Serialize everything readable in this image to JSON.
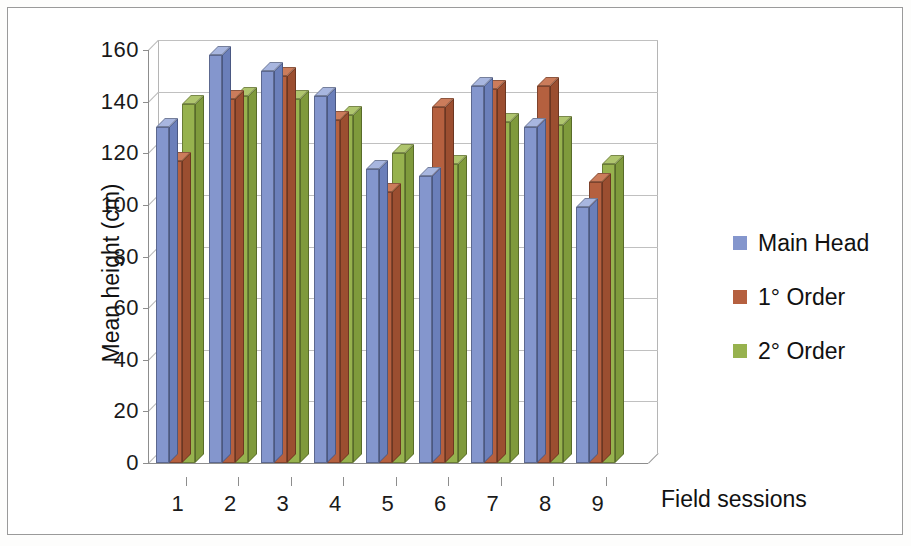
{
  "chart_data": {
    "type": "bar",
    "title": "",
    "xlabel": "Field sessions",
    "ylabel": "Mean height (cm)",
    "categories": [
      "1",
      "2",
      "3",
      "4",
      "5",
      "6",
      "7",
      "8",
      "9"
    ],
    "ylim": [
      0,
      160
    ],
    "yticks": [
      0,
      20,
      40,
      60,
      80,
      100,
      120,
      140,
      160
    ],
    "ytick_labels": [
      "0",
      "20",
      "40",
      "60",
      "80",
      "100",
      "120",
      "140",
      "160"
    ],
    "grid": true,
    "legend_position": "right",
    "style": "3d-clustered-column",
    "series": [
      {
        "name": "Main Head",
        "color": "#8496cd",
        "values": [
          130,
          158,
          152,
          142,
          114,
          111,
          146,
          130,
          99
        ]
      },
      {
        "name": "1° Order",
        "color": "#b5603f",
        "values": [
          117,
          141,
          150,
          133,
          105,
          138,
          145,
          146,
          109
        ]
      },
      {
        "name": "2° Order",
        "color": "#97b24e",
        "values": [
          139,
          142,
          141,
          135,
          120,
          116,
          132,
          131,
          116
        ]
      }
    ]
  },
  "axes": {
    "y_title": "Mean height (cm)",
    "x_title": "Field sessions"
  },
  "legend": {
    "items": [
      {
        "label": "Main Head",
        "color": "#8496cd"
      },
      {
        "label": "1° Order",
        "color": "#b5603f"
      },
      {
        "label": "2° Order",
        "color": "#97b24e"
      }
    ]
  }
}
